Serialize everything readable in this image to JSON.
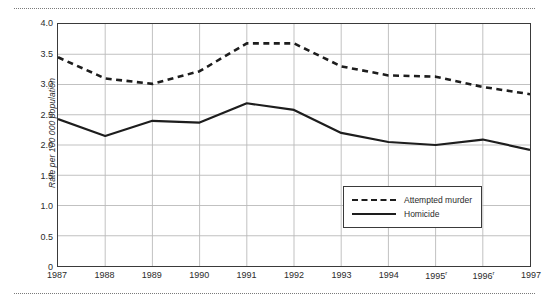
{
  "chart_data": {
    "type": "line",
    "title": "",
    "subtitle": "",
    "xlabel": "",
    "ylabel": "Rate per 100 000 population",
    "categories": [
      "1987",
      "1988",
      "1989",
      "1990",
      "1991",
      "1992",
      "1993",
      "1994",
      "1995",
      "1996",
      "1997"
    ],
    "tick_labels": [
      "1987",
      "1988",
      "1989",
      "1990",
      "1991",
      "1992",
      "1993",
      "1994",
      "1995ʳ",
      "1996ʳ",
      "1997"
    ],
    "tick_superscripts": [
      "",
      "",
      "",
      "",
      "",
      "",
      "",
      "",
      "r",
      "r",
      ""
    ],
    "series": [
      {
        "name": "Attempted murder",
        "style": "dashed",
        "color": "#1d1d1d",
        "values": [
          3.45,
          3.1,
          3.01,
          3.22,
          3.68,
          3.68,
          3.3,
          3.15,
          3.13,
          2.96,
          2.84
        ]
      },
      {
        "name": "Homicide",
        "style": "solid",
        "color": "#1d1d1d",
        "values": [
          2.43,
          2.15,
          2.4,
          2.37,
          2.69,
          2.58,
          2.2,
          2.05,
          2.0,
          2.09,
          1.92
        ]
      }
    ],
    "ylim": [
      0,
      4.0
    ],
    "ytick_values": [
      0,
      0.5,
      1.0,
      1.5,
      2.0,
      2.5,
      3.0,
      3.5,
      4.0
    ],
    "ytick_labels": [
      "0",
      "0.5",
      "1.0",
      "1.5",
      "2.0",
      "2.5",
      "3.0",
      "3.5",
      "4.0"
    ],
    "grid": true,
    "grid_color": "#b9b9b9",
    "legend_position": "bottom-right",
    "legend_entries": [
      "Attempted murder",
      "Homicide"
    ]
  },
  "decoration": {
    "top_rule": "dotted-rule",
    "bottom_rule": "dotted-rule"
  }
}
